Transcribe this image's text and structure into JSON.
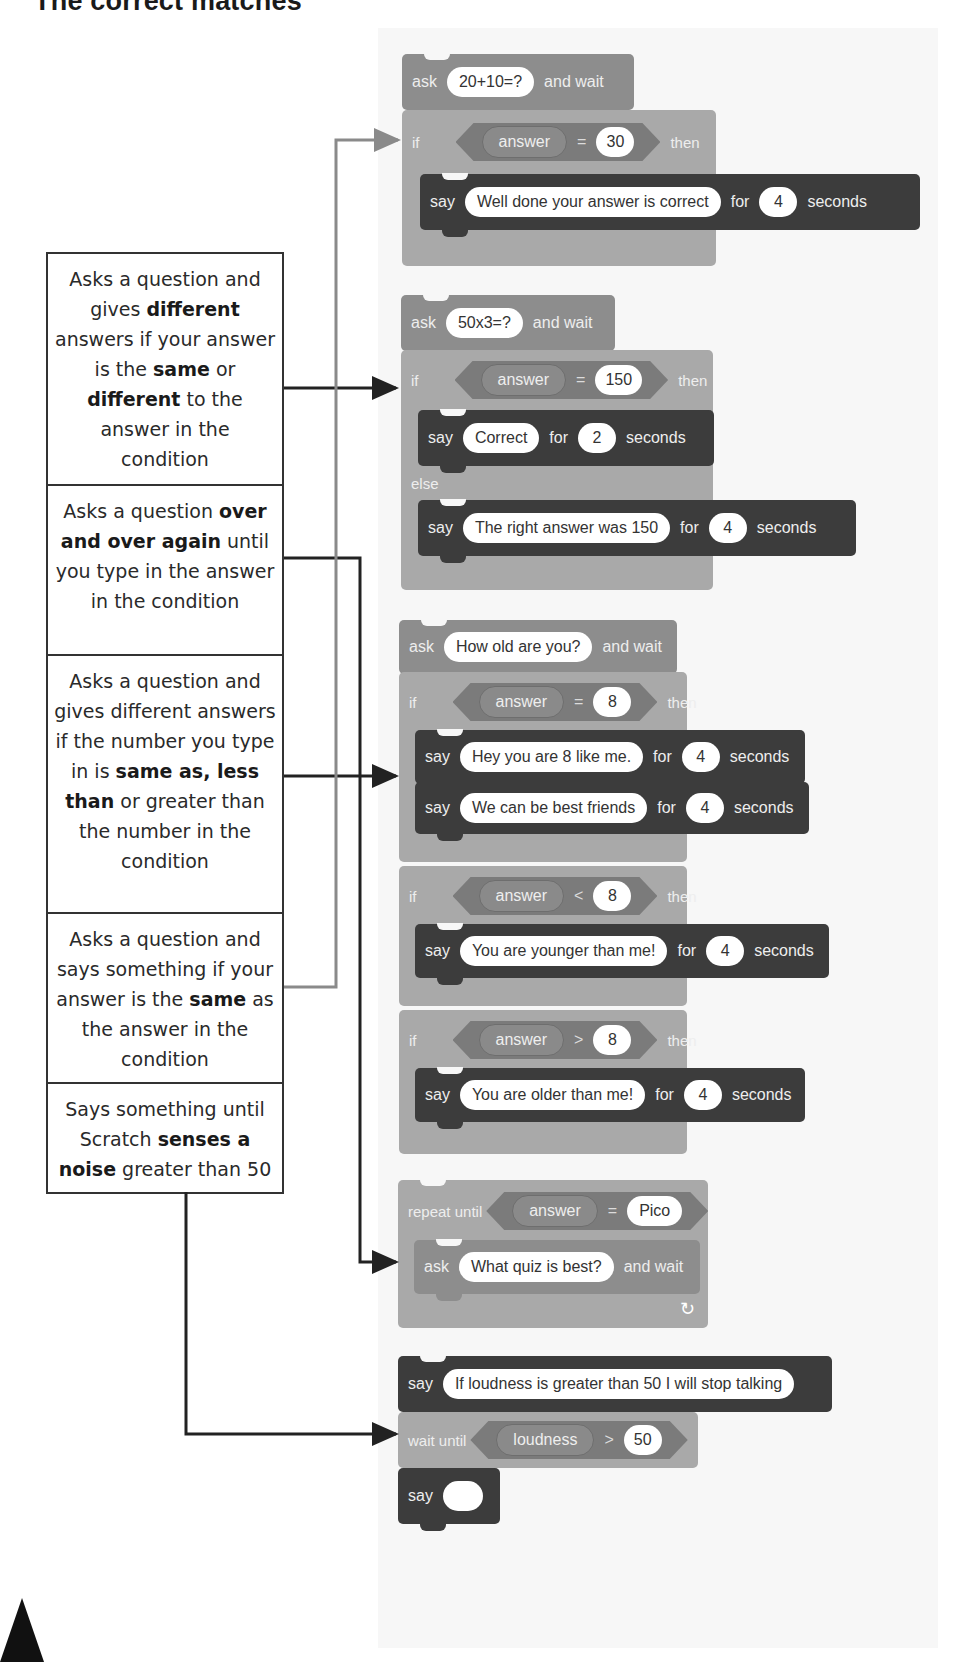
{
  "title": "The correct matches",
  "descriptions": [
    {
      "id": "d1",
      "parts": [
        "Asks a question and gives ",
        "different",
        " answers if your answer is the ",
        "same",
        " or ",
        "different",
        " to the answer in the condition"
      ]
    },
    {
      "id": "d2",
      "parts": [
        "Asks a question ",
        "over and over again",
        " until you type in the answer in the condition"
      ]
    },
    {
      "id": "d3",
      "parts": [
        "Asks a question and gives different answers if the number you type in is ",
        "same as, less than",
        " or greater than the number in the condition"
      ]
    },
    {
      "id": "d4",
      "parts": [
        "Asks a question and says something if your answer is the ",
        "same",
        " as the answer in the condition"
      ]
    },
    {
      "id": "d5",
      "parts": [
        "Says something until Scratch ",
        "senses a noise",
        " greater than 50"
      ]
    }
  ],
  "keywords": {
    "ask": "ask",
    "and_wait": "and wait",
    "if": "if",
    "then": "then",
    "else": "else",
    "say": "say",
    "for": "for",
    "seconds": "seconds",
    "answer": "answer",
    "repeat_until": "repeat until",
    "wait_until": "wait until",
    "loudness": "loudness",
    "eq": "=",
    "lt": "<",
    "gt": ">",
    "loop_arrow": "↻"
  },
  "scripts": {
    "s1": {
      "question": "20+10=?",
      "cond_value": "30",
      "say_text": "Well done your answer is correct",
      "say_secs": "4"
    },
    "s2": {
      "question": "50x3=?",
      "cond_value": "150",
      "say_text": "Correct",
      "say_secs": "2",
      "else_text": "The right answer was 150",
      "else_secs": "4"
    },
    "s3": {
      "question": "How old are you?",
      "if1_value": "8",
      "say1_text": "Hey you are 8 like me.",
      "say1_secs": "4",
      "say2_text": "We can be best friends",
      "say2_secs": "4",
      "if2_value": "8",
      "say3_text": "You are younger than me!",
      "say3_secs": "4",
      "if3_value": "8",
      "say4_text": "You are older than me!",
      "say4_secs": "4"
    },
    "s4": {
      "cond_value": "Pico",
      "question": "What quiz is best?"
    },
    "s5": {
      "say_text": "If loudness is greater than 50 I will stop talking",
      "cond_value": "50",
      "say_final": ""
    }
  },
  "colors": {
    "sensing": "#8d8d8d",
    "control": "#a9a9a9",
    "looks": "#3c3c3c",
    "line_dark": "#222222",
    "line_grey": "#8a8a8a"
  }
}
